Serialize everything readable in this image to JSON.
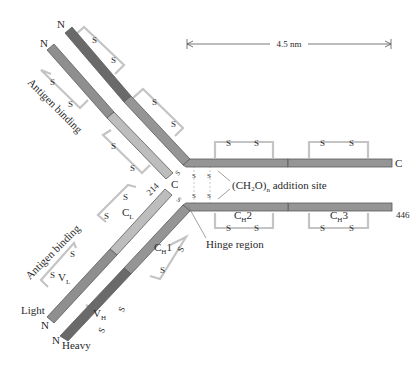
{
  "colors": {
    "heavy_variable": "#6a6a6a",
    "heavy_constant": "#959595",
    "light_variable": "#8f8f8f",
    "light_constant": "#bdbdbd",
    "disulfide_bracket": "#c4c4c4",
    "text": "#2a2a2a"
  },
  "scale_bar": {
    "label": "4.5 nm"
  },
  "labels": {
    "antigen_binding_top": "Antigen binding",
    "antigen_binding_bottom": "Antigen binding",
    "carbohydrate": "(CH₂O)",
    "carbohydrate_sub": "n",
    "carbohydrate_suffix": " addition site",
    "hinge": "Hinge region",
    "light": "Light",
    "heavy": "Heavy",
    "n_terminus": "N",
    "c_terminus": "C",
    "residue_214": "214",
    "residue_446": "446",
    "disulfide_s": "S",
    "domains": {
      "cl": "C",
      "cl_sub": "L",
      "vl": "V",
      "vl_sub": "L",
      "vh": "V",
      "vh_sub": "H",
      "ch1": "C",
      "ch1_sub": "H",
      "ch1_num": "1",
      "ch2": "C",
      "ch2_sub": "H",
      "ch2_num": "2",
      "ch3": "C",
      "ch3_sub": "H",
      "ch3_num": "3"
    }
  }
}
